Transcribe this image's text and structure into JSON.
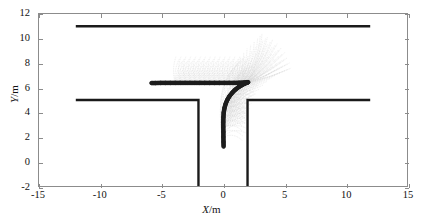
{
  "chart_data": {
    "type": "line",
    "title": "",
    "xlabel": "X/m",
    "ylabel": "Y/m",
    "xlim": [
      -15,
      15
    ],
    "ylim": [
      -2,
      12
    ],
    "xticks": [
      -15,
      -10,
      -5,
      0,
      5,
      10,
      15
    ],
    "yticks": [
      -2,
      0,
      2,
      4,
      6,
      8,
      10,
      12
    ],
    "xtick_labels": [
      "-15",
      "-10",
      "-5",
      "0",
      "5",
      "10",
      "15"
    ],
    "ytick_labels": [
      "-2",
      "0",
      "2",
      "4",
      "6",
      "8",
      "10",
      "12"
    ],
    "grid": false,
    "legend": null,
    "series": [
      {
        "name": "road-boundary-top",
        "style": "solid-thick-black",
        "color": "#1a1a1a",
        "points": [
          [
            -12,
            11
          ],
          [
            12,
            11
          ]
        ]
      },
      {
        "name": "road-boundary-left",
        "style": "solid-thick-black",
        "color": "#1a1a1a",
        "points": [
          [
            -12,
            5
          ],
          [
            -2,
            5
          ],
          [
            -2,
            -2
          ]
        ]
      },
      {
        "name": "road-boundary-right",
        "style": "solid-thick-black",
        "color": "#1a1a1a",
        "points": [
          [
            2,
            -2
          ],
          [
            2,
            5
          ],
          [
            12,
            5
          ]
        ]
      },
      {
        "name": "executed-trajectory",
        "style": "beaded-dotted-thick",
        "color": "#262626",
        "points": [
          [
            0.05,
            1.2
          ],
          [
            0.04,
            1.6
          ],
          [
            0.03,
            2.0
          ],
          [
            0.03,
            2.4
          ],
          [
            0.02,
            2.8
          ],
          [
            0.02,
            3.2
          ],
          [
            0.03,
            3.6
          ],
          [
            0.06,
            3.98
          ],
          [
            0.12,
            4.35
          ],
          [
            0.22,
            4.7
          ],
          [
            0.36,
            5.03
          ],
          [
            0.54,
            5.33
          ],
          [
            0.76,
            5.6
          ],
          [
            1.0,
            5.84
          ],
          [
            1.26,
            6.04
          ],
          [
            1.52,
            6.2
          ],
          [
            1.76,
            6.33
          ],
          [
            1.94,
            6.41
          ],
          [
            2.05,
            6.45
          ],
          [
            1.7,
            6.42
          ],
          [
            1.3,
            6.4
          ],
          [
            0.9,
            6.39
          ],
          [
            0.5,
            6.39
          ],
          [
            0.1,
            6.39
          ],
          [
            -0.3,
            6.39
          ],
          [
            -0.7,
            6.39
          ],
          [
            -1.1,
            6.39
          ],
          [
            -1.5,
            6.39
          ],
          [
            -1.9,
            6.39
          ],
          [
            -2.3,
            6.39
          ],
          [
            -2.7,
            6.39
          ],
          [
            -3.1,
            6.39
          ],
          [
            -3.5,
            6.39
          ],
          [
            -3.9,
            6.39
          ],
          [
            -4.3,
            6.39
          ],
          [
            -4.7,
            6.39
          ],
          [
            -5.1,
            6.39
          ],
          [
            -5.5,
            6.38
          ],
          [
            -5.85,
            6.38
          ]
        ]
      },
      {
        "name": "candidate-prediction-fans",
        "style": "thin-gray-dotted",
        "color": "#b4b4b4",
        "description": "Dense bundle of sampled candidate trajectories fanning upward and sideways from successive points along the executed path"
      }
    ]
  },
  "figure": {
    "xlabel_italic": "X",
    "xlabel_unit": "/m",
    "ylabel_italic": "Y",
    "ylabel_unit": "/m"
  }
}
